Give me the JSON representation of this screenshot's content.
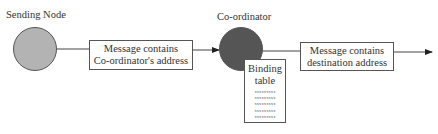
{
  "diagram": {
    "sending_node": {
      "label": "Sending Node",
      "color": "#b3b3b3"
    },
    "coordinator": {
      "label": "Co-ordinator",
      "color": "#555555"
    },
    "message_1": {
      "line1": "Message contains",
      "line2": "Co-ordinator's address"
    },
    "message_2": {
      "line1": "Message contains",
      "line2": "destination address"
    },
    "binding_table": {
      "title_line1": "Binding",
      "title_line2": "table",
      "rows": [
        "xxxxxxxxx",
        "xxxxxxxxx",
        "xxxxxxxxx",
        "xxxxxxxxx",
        "xxxxxxxxx"
      ]
    }
  }
}
